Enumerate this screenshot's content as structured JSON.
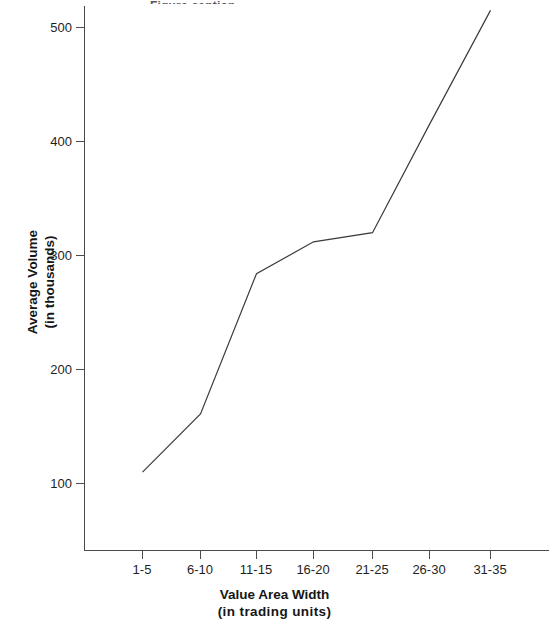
{
  "chart_data": {
    "type": "line",
    "title": "",
    "xlabel": "Value Area Width",
    "xlabel_line2": "(in  trading  units)",
    "ylabel": "Average Volume",
    "ylabel_line2": "(in thousands)",
    "categories": [
      "1-5",
      "6-10",
      "11-15",
      "16-20",
      "21-25",
      "26-30",
      "31-35"
    ],
    "values": [
      110,
      161,
      284,
      312,
      320,
      415,
      515
    ],
    "yticks": [
      100,
      200,
      300,
      400,
      500
    ],
    "ylim": [
      60,
      520
    ],
    "grid": false,
    "legend": null,
    "series": [
      {
        "name": "Average Volume",
        "values": [
          110,
          161,
          284,
          312,
          320,
          415,
          515
        ]
      }
    ],
    "line_color": "#3b3b3b",
    "axis_color": "#4a4a4a",
    "background": "#ffffff",
    "markers": false,
    "note": "Line is clipped at the top edge of the image between 21-25 and 31-35 region"
  },
  "axis_titles": {
    "x_line1": "Value Area Width",
    "x_line2": "(in  trading  units)",
    "y_line1": "Average Volume",
    "y_line2": "(in thousands)"
  },
  "ticks": {
    "y": [
      "500",
      "400",
      "300",
      "200",
      "100"
    ],
    "x": [
      "1-5",
      "6-10",
      "11-15",
      "16-20",
      "21-25",
      "26-30",
      "31-35"
    ]
  },
  "title_remnant": "Figure caption"
}
